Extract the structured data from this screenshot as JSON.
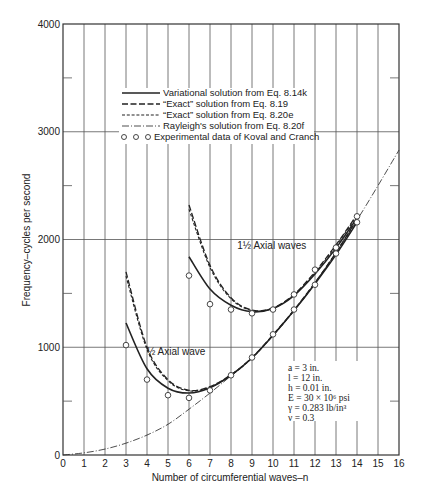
{
  "chart_data": {
    "type": "line",
    "title": "",
    "xlabel": "Number of circumferential waves–n",
    "ylabel": "Frequency–cycles per second",
    "xlim": [
      0,
      16
    ],
    "ylim": [
      0,
      4000
    ],
    "xticks": [
      0,
      1,
      2,
      3,
      4,
      5,
      6,
      7,
      8,
      9,
      10,
      11,
      12,
      13,
      14,
      15,
      16
    ],
    "yticks": [
      0,
      1000,
      2000,
      3000,
      4000
    ],
    "y_minor_ticks": [
      500,
      1500,
      2500,
      3500
    ],
    "grid": {
      "vertical_every": 1,
      "horizontal": [
        1000,
        2000,
        3000
      ]
    },
    "legend_position": "upper-left inside",
    "legend": [
      {
        "label": "Variational solution from Eq. 8.14k",
        "style": "solid"
      },
      {
        "label": "“Exact” solution from Eq. 8.19",
        "style": "long-dash"
      },
      {
        "label": "“Exact” solution from Eq. 8.20e",
        "style": "short-dash"
      },
      {
        "label": "Rayleigh's solution from Eq. 8.20f",
        "style": "dash-dot"
      },
      {
        "label": "Experimental data of Koval and Cranch",
        "style": "circles"
      }
    ],
    "annotations": [
      {
        "text": "1½  Axial waves",
        "x": 8.3,
        "y": 1910
      },
      {
        "text": "½  Axial wave",
        "x": 4.0,
        "y": 930
      }
    ],
    "parameters": [
      "a = 3 in.",
      "l = 12 in.",
      "h = 0.01 in.",
      "E = 30 × 10⁶ psi",
      "γ = 0.283 lb/in³",
      "ν = 0.3"
    ],
    "series": [
      {
        "name": "Variational (1/2 axial wave)",
        "style": "solid",
        "x": [
          3,
          4,
          5,
          6,
          7,
          8,
          9,
          10,
          11,
          12,
          13,
          14
        ],
        "y": [
          1225,
          800,
          620,
          575,
          625,
          740,
          900,
          1110,
          1340,
          1590,
          1860,
          2160
        ]
      },
      {
        "name": "Exact 8.19 (1/2 axial wave)",
        "style": "long-dash",
        "x": [
          3,
          4,
          5,
          6,
          7,
          8,
          9,
          10,
          11,
          12,
          13,
          14
        ],
        "y": [
          1700,
          1000,
          700,
          600,
          635,
          745,
          905,
          1115,
          1345,
          1600,
          1880,
          2190
        ]
      },
      {
        "name": "Exact 8.20e (1/2 axial wave)",
        "style": "short-dash",
        "x": [
          3,
          4,
          5,
          6,
          7,
          8,
          9,
          10,
          11,
          12,
          13,
          14
        ],
        "y": [
          1660,
          980,
          690,
          595,
          630,
          740,
          900,
          1110,
          1340,
          1595,
          1875,
          2185
        ]
      },
      {
        "name": "Variational (1 1/2 axial waves)",
        "style": "solid",
        "x": [
          6,
          7,
          8,
          9,
          10,
          11,
          12,
          13,
          14
        ],
        "y": [
          1840,
          1540,
          1390,
          1330,
          1360,
          1480,
          1680,
          1920,
          2200
        ]
      },
      {
        "name": "Exact 8.19 (1 1/2 axial waves)",
        "style": "long-dash",
        "x": [
          6,
          7,
          8,
          9,
          10,
          11,
          12,
          13,
          14
        ],
        "y": [
          2320,
          1760,
          1460,
          1345,
          1365,
          1490,
          1700,
          1950,
          2230
        ]
      },
      {
        "name": "Exact 8.20e (1 1/2 axial waves)",
        "style": "short-dash",
        "x": [
          6,
          7,
          8,
          9,
          10,
          11,
          12,
          13,
          14
        ],
        "y": [
          2280,
          1740,
          1450,
          1340,
          1362,
          1485,
          1690,
          1940,
          2220
        ]
      },
      {
        "name": "Rayleigh",
        "style": "dash-dot",
        "x": [
          0,
          1,
          2,
          3,
          4,
          5,
          6,
          7,
          8,
          9,
          10,
          11,
          12,
          13,
          14,
          15,
          16
        ],
        "y": [
          0,
          20,
          55,
          110,
          185,
          285,
          425,
          575,
          735,
          905,
          1110,
          1340,
          1600,
          1880,
          2180,
          2500,
          2830
        ]
      },
      {
        "name": "Experimental (1/2 axial wave)",
        "style": "circles",
        "x": [
          3,
          4,
          5,
          6,
          7,
          8,
          9,
          10,
          11,
          12,
          13,
          14
        ],
        "y": [
          1020,
          700,
          555,
          530,
          600,
          740,
          905,
          1120,
          1350,
          1580,
          1870,
          2160
        ]
      },
      {
        "name": "Experimental (1 1/2 axial waves)",
        "style": "circles",
        "x": [
          6,
          7,
          8,
          9,
          10,
          11,
          12,
          13,
          14
        ],
        "y": [
          1665,
          1400,
          1350,
          1315,
          1350,
          1490,
          1720,
          1925,
          2215
        ]
      }
    ]
  }
}
